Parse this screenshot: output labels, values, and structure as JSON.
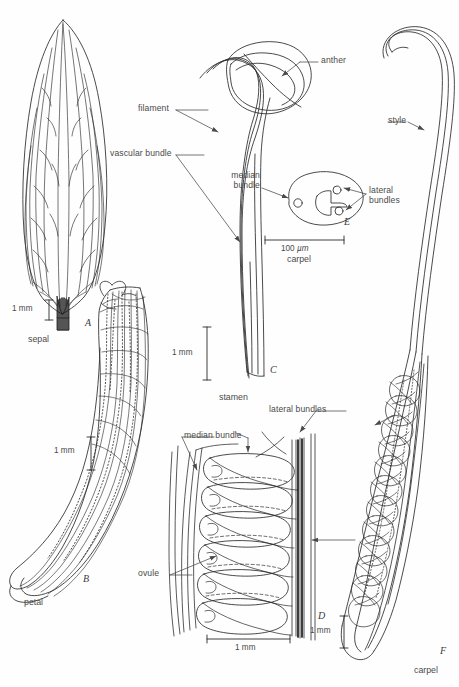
{
  "figure": {
    "type": "botanical-line-drawing-plate",
    "background_color": "#fefefe",
    "ink_color": "#2b2b2b",
    "text_color": "#4a4a4a"
  },
  "panels": [
    {
      "letter": "A",
      "organ": "sepal",
      "scale": "1 mm",
      "orientation": "vertical"
    },
    {
      "letter": "B",
      "organ": "petal",
      "scale": "1 mm",
      "orientation": "vertical"
    },
    {
      "letter": "C",
      "organ": "stamen",
      "scale": "1 mm",
      "orientation": "vertical"
    },
    {
      "letter": "D",
      "organ": "",
      "scale": "1 mm",
      "orientation": "horizontal"
    },
    {
      "letter": "E",
      "organ": "carpel",
      "scale": "100 µm",
      "orientation": "horizontal"
    },
    {
      "letter": "F",
      "organ": "carpel",
      "scale": "1 mm",
      "orientation": "vertical"
    }
  ],
  "labels": {
    "anther": "anther",
    "filament": "filament",
    "vascular_bundle": "vascular bundle",
    "median_bundle_e_line1": "median",
    "median_bundle_e_line2": "bundle",
    "lateral_bundles_e_line1": "lateral",
    "lateral_bundles_e_line2": "bundles",
    "style": "style",
    "lateral_bundles_right_line1": "lateral",
    "lateral_bundles_right_line2": "bundles",
    "lateral_bundles_d": "lateral bundles",
    "median_bundle_d": "median bundle",
    "ovule": "ovule"
  },
  "organ_names": {
    "sepal": "sepal",
    "petal": "petal",
    "stamen": "stamen",
    "carpel_e": "carpel",
    "carpel_f": "carpel"
  },
  "panel_letters": {
    "a": "A",
    "b": "B",
    "c": "C",
    "d": "D",
    "e": "E",
    "f": "F"
  },
  "scales": {
    "a": "1 mm",
    "b": "1 mm",
    "c": "1 mm",
    "d": "1 mm",
    "e_value": "100 ",
    "e_unit": "µm",
    "f": "1 mm"
  }
}
